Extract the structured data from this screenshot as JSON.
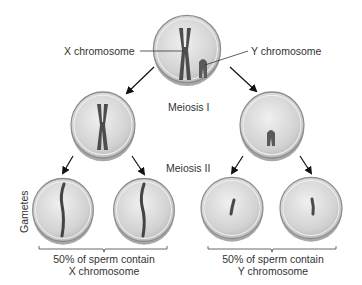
{
  "diagram": {
    "labels": {
      "x_chromosome": "X chromosome",
      "y_chromosome": "Y chromosome",
      "meiosis_1": "Meiosis I",
      "meiosis_2": "Meiosis II",
      "gametes": "Gametes",
      "x_group_line1": "50% of sperm contain",
      "x_group_line2": "X chromosome",
      "y_group_line1": "50% of sperm contain",
      "y_group_line2": "Y chromosome"
    },
    "nodes": [
      {
        "id": "parent",
        "contents": [
          "X chromosome (replicated)",
          "Y chromosome (replicated)"
        ]
      },
      {
        "id": "meiosis1-x",
        "contents": [
          "X chromosome (replicated)"
        ]
      },
      {
        "id": "meiosis1-y",
        "contents": [
          "Y chromosome (replicated)"
        ]
      },
      {
        "id": "gamete-x-1",
        "contents": [
          "X chromatid"
        ]
      },
      {
        "id": "gamete-x-2",
        "contents": [
          "X chromatid"
        ]
      },
      {
        "id": "gamete-y-1",
        "contents": [
          "Y chromatid"
        ]
      },
      {
        "id": "gamete-y-2",
        "contents": [
          "Y chromatid"
        ]
      }
    ],
    "edges": [
      [
        "parent",
        "meiosis1-x"
      ],
      [
        "parent",
        "meiosis1-y"
      ],
      [
        "meiosis1-x",
        "gamete-x-1"
      ],
      [
        "meiosis1-x",
        "gamete-x-2"
      ],
      [
        "meiosis1-y",
        "gamete-y-1"
      ],
      [
        "meiosis1-y",
        "gamete-y-2"
      ]
    ],
    "colors": {
      "cell_fill": "#d6d6d6",
      "cell_rim": "#9a9a9a",
      "chromosome": "#4a4a4a",
      "text": "#333333",
      "arrow": "#111111"
    }
  }
}
